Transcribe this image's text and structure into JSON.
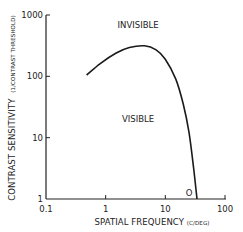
{
  "chart_data": {
    "type": "line",
    "title": "",
    "xlabel": "SPATIAL FREQUENCY",
    "xlabel_unit": "(C/DEG)",
    "ylabel": "CONTRAST SENSITIVITY",
    "ylabel_unit": "(1/CONTRAST THRESHOLD)",
    "xscale": "log",
    "yscale": "log",
    "xlim": [
      0.1,
      100
    ],
    "ylim": [
      1,
      1000
    ],
    "xticks": [
      0.1,
      1,
      10,
      100
    ],
    "xtick_labels": [
      "0.1",
      "1",
      "10",
      "100"
    ],
    "yticks": [
      1,
      10,
      100,
      1000
    ],
    "ytick_labels": [
      "1",
      "10",
      "100",
      "1000"
    ],
    "grid": false,
    "legend": null,
    "series": [
      {
        "name": "Contrast sensitivity function",
        "x": [
          0.48,
          0.8,
          1.5,
          2.5,
          4.5,
          7,
          10,
          15,
          20,
          25,
          30,
          34
        ],
        "y": [
          105,
          160,
          240,
          295,
          315,
          270,
          190,
          90,
          35,
          12,
          3,
          1
        ]
      }
    ],
    "annotations": [
      {
        "text": "INVISIBLE",
        "x": 3.5,
        "y": 700
      },
      {
        "text": "VISIBLE",
        "x": 3.5,
        "y": 20
      },
      {
        "text": "O",
        "x": 25,
        "y": 1.1
      }
    ]
  }
}
